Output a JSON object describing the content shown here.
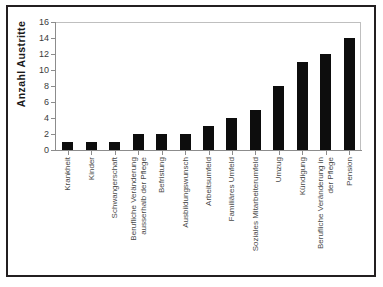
{
  "chart_data": {
    "type": "bar",
    "title": "",
    "subtitle": "",
    "xlabel": "",
    "ylabel": "Anzahl  Austritte",
    "ylim": [
      0,
      16
    ],
    "ytick_values": [
      0,
      2,
      4,
      6,
      8,
      10,
      12,
      14,
      16
    ],
    "ytick_labels": [
      "0",
      "2",
      "4",
      "6",
      "8",
      "10",
      "12",
      "14",
      "16"
    ],
    "grid": false,
    "legend": false,
    "legend_position": "none",
    "orientation": "vertical",
    "bar_color": "#0d0d0d",
    "categories": [
      "Krankheit",
      "Kinder",
      "Schwangerschaft",
      "Berufliche Veränderung ausserhalb der Pflege",
      "Befristung",
      "Ausbildungswunsch",
      "Arbeitsumfeld",
      "Familiäres Umfeld",
      "Soziales Mitarbeiterumfeld",
      "Umzug",
      "Kündigung",
      "Berufliche Veränderung in der Pflege",
      "Pension"
    ],
    "category_lines": [
      [
        "Krankheit"
      ],
      [
        "Kinder"
      ],
      [
        "Schwangerschaft"
      ],
      [
        "Berufliche Veränderung",
        "ausserhalb der Pflege"
      ],
      [
        "Befristung"
      ],
      [
        "Ausbildungswunsch"
      ],
      [
        "Arbeitsumfeld"
      ],
      [
        "Familiäres Umfeld"
      ],
      [
        "Soziales Mitarbeiterumfeld"
      ],
      [
        "Umzug"
      ],
      [
        "Kündigung"
      ],
      [
        "Berufliche Veränderung in",
        "der Pflege"
      ],
      [
        "Pension"
      ]
    ],
    "values": [
      1,
      1,
      1,
      2,
      2,
      2,
      3,
      4,
      5,
      8,
      11,
      12,
      14
    ]
  }
}
